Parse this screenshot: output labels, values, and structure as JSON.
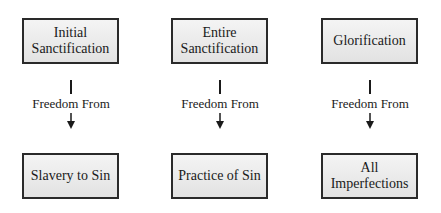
{
  "columns": [
    {
      "stage": "Initial\nSanctification",
      "connector": "Freedom From",
      "result": "Slavery to Sin"
    },
    {
      "stage": "Entire\nSanctification",
      "connector": "Freedom From",
      "result": "Practice of Sin"
    },
    {
      "stage": "Glorification",
      "connector": "Freedom From",
      "result": "All\nImperfections"
    }
  ],
  "colors": {
    "border": "#2a2a2a",
    "fill_top": "#f4f4f4",
    "fill_bottom": "#e2e2e2"
  }
}
